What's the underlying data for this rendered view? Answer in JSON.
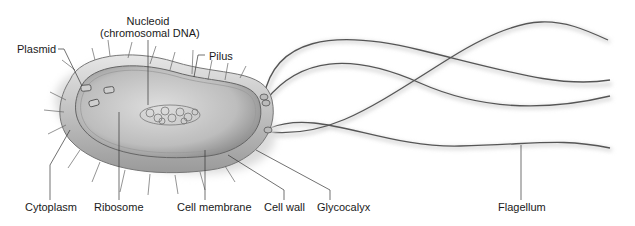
{
  "diagram": {
    "labels": {
      "nucleoid_line1": "Nucleoid",
      "nucleoid_line2": "(chromosomal DNA)",
      "plasmid": "Plasmid",
      "pilus": "Pilus",
      "cytoplasm": "Cytoplasm",
      "ribosome": "Ribosome",
      "cell_membrane": "Cell membrane",
      "cell_wall": "Cell wall",
      "glycocalyx": "Glycocalyx",
      "flagellum": "Flagellum"
    },
    "colors": {
      "background": "#ffffff",
      "text": "#1a1a1a",
      "leader_line": "#333333",
      "cell_fill": "#c8c8c8",
      "capsule": "#d9d9d9",
      "flagella": "#555555"
    }
  }
}
